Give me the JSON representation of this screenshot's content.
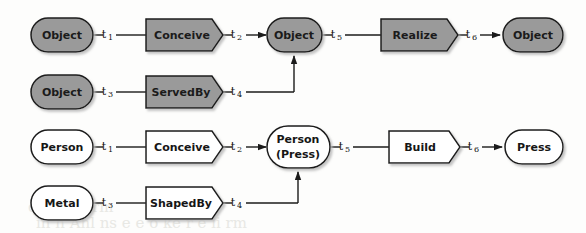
{
  "diagram": {
    "background_color": "#fdfdfc",
    "shaded_fill": "#9a9a9a",
    "plain_fill": "#ffffff",
    "stroke_color": "#1b1b1b",
    "rows": [
      {
        "id": "row-1",
        "style": "shaded",
        "nodes": [
          {
            "id": "n1",
            "kind": "oval",
            "label": "Object"
          },
          {
            "id": "n2",
            "kind": "hexagon",
            "label": "Conceive"
          },
          {
            "id": "n3",
            "kind": "oval",
            "label": "Object"
          },
          {
            "id": "n4",
            "kind": "hexagon",
            "label": "Realize"
          },
          {
            "id": "n5",
            "kind": "oval",
            "label": "Object"
          }
        ],
        "transitions": [
          "t1",
          "t2",
          "t5",
          "t6"
        ]
      },
      {
        "id": "row-2",
        "style": "shaded",
        "nodes": [
          {
            "id": "n6",
            "kind": "oval",
            "label": "Object"
          },
          {
            "id": "n7",
            "kind": "hexagon",
            "label": "ServedBy"
          }
        ],
        "transitions": [
          "t3",
          "t4"
        ]
      },
      {
        "id": "row-3",
        "style": "plain",
        "nodes": [
          {
            "id": "n8",
            "kind": "oval",
            "label": "Person"
          },
          {
            "id": "n9",
            "kind": "hexagon",
            "label": "Conceive"
          },
          {
            "id": "n10",
            "kind": "oval",
            "label": "Person",
            "label2": "(Press)"
          },
          {
            "id": "n11",
            "kind": "hexagon",
            "label": "Build"
          },
          {
            "id": "n12",
            "kind": "oval",
            "label": "Press"
          }
        ],
        "transitions": [
          "t1",
          "t2",
          "t5",
          "t6"
        ]
      },
      {
        "id": "row-4",
        "style": "plain",
        "nodes": [
          {
            "id": "n13",
            "kind": "oval",
            "label": "Metal"
          },
          {
            "id": "n14",
            "kind": "hexagon",
            "label": "ShapedBy"
          }
        ],
        "transitions": [
          "t3",
          "t4"
        ]
      }
    ],
    "transition_labels": {
      "t1": {
        "base": "t",
        "sub": "1"
      },
      "t2": {
        "base": "t",
        "sub": "2"
      },
      "t3": {
        "base": "t",
        "sub": "3"
      },
      "t4": {
        "base": "t",
        "sub": "4"
      },
      "t5": {
        "base": "t",
        "sub": "5"
      },
      "t6": {
        "base": "t",
        "sub": "6"
      }
    },
    "labels": {
      "object": "Object",
      "conceive": "Conceive",
      "realize": "Realize",
      "servedby": "ServedBy",
      "person": "Person",
      "person_press_line1": "Person",
      "person_press_line2": "(Press)",
      "build": "Build",
      "press": "Press",
      "metal": "Metal",
      "shapedby": "ShapedBy",
      "t1": "t",
      "t1_sub": "1",
      "t2": "t",
      "t2_sub": "2",
      "t3": "t",
      "t3_sub": "3",
      "t4": "t",
      "t4_sub": "4",
      "t5": "t",
      "t5_sub": "5",
      "t6": "t",
      "t6_sub": "6"
    },
    "bleed": {
      "line1": "qo   hrr  r   rm",
      "line2": "in  h   Ahl  ns  e     e  o  ke  r  e  li  rm"
    }
  }
}
